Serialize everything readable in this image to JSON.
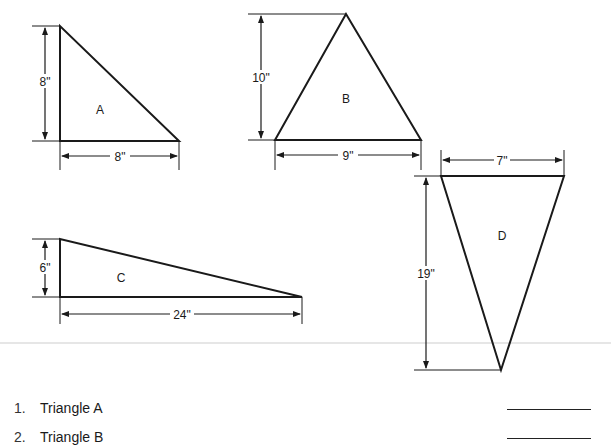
{
  "triangles": [
    {
      "id": "A",
      "label": "A",
      "height_label": "8\"",
      "base_label": "8\""
    },
    {
      "id": "B",
      "label": "B",
      "height_label": "10\"",
      "base_label": "9\""
    },
    {
      "id": "C",
      "label": "C",
      "height_label": "6\"",
      "base_label": "24\""
    },
    {
      "id": "D",
      "label": "D",
      "height_label": "19\"",
      "base_label": "7\""
    }
  ],
  "questions": [
    {
      "number": "1.",
      "text": "Triangle A"
    },
    {
      "number": "2.",
      "text": "Triangle B"
    }
  ]
}
